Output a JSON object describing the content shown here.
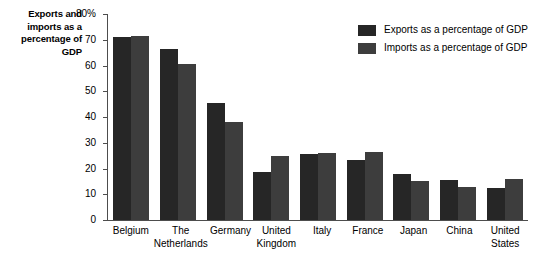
{
  "chart_data": {
    "type": "bar",
    "title": "Exports and imports as a percentage of GDP",
    "xlabel": "",
    "ylabel": "Exports and imports as a percentage of GDP",
    "ylim": [
      0,
      80
    ],
    "ytick_labels": [
      "80%",
      "70",
      "60",
      "50",
      "40",
      "30",
      "20",
      "10",
      "0"
    ],
    "ytick_values": [
      80,
      70,
      60,
      50,
      40,
      30,
      20,
      10,
      0
    ],
    "grid": false,
    "legend_position": "top-right",
    "categories": [
      "Belgium",
      "The Netherlands",
      "Germany",
      "United Kingdom",
      "Italy",
      "France",
      "Japan",
      "China",
      "United States"
    ],
    "series": [
      {
        "name": "Exports as a percentage of GDP",
        "color": "#262626",
        "values": [
          71,
          66.5,
          45.5,
          18.5,
          25.5,
          23.5,
          18,
          15.5,
          12.5
        ]
      },
      {
        "name": "Imports as a percentage of GDP",
        "color": "#3d3d3d",
        "values": [
          71.5,
          60.5,
          38,
          25,
          26,
          26.5,
          15,
          13,
          16
        ]
      }
    ]
  },
  "axis_title_text": "Exports and imports as a percentage of GDP",
  "colors": {
    "exports": "#262626",
    "imports": "#3d3d3d",
    "axis": "#4d4d4d",
    "background": "#ffffff"
  }
}
